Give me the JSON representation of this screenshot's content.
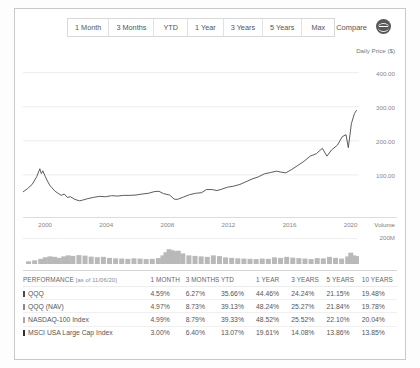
{
  "toolbar": {
    "ranges": [
      {
        "label": "1 Month"
      },
      {
        "label": "3 Months"
      },
      {
        "label": "YTD"
      },
      {
        "label": "1 Year"
      },
      {
        "label": "3 Years"
      },
      {
        "label": "5 Years"
      },
      {
        "label": "Max"
      }
    ],
    "compare_label": "Compare",
    "compare_icon": "minus-circle-icon"
  },
  "chart_data": {
    "type": "line",
    "title": "",
    "ylabel": "Daily Price ($)",
    "xlabel": "",
    "ytick_labels": [
      "400.00",
      "300.00",
      "200.00",
      "100.00"
    ],
    "ylim": [
      0,
      440
    ],
    "xtick_labels": [
      "2000",
      "2004",
      "2008",
      "2012",
      "2016",
      "2020"
    ],
    "xlim": [
      1999,
      2021
    ],
    "grid": true,
    "legend": "none",
    "series": [
      {
        "name": "QQQ",
        "color": "#4a4a4a",
        "x": [
          1999.0,
          1999.3,
          1999.6,
          1999.9,
          2000.1,
          2000.2,
          2000.3,
          2000.45,
          2000.6,
          2000.75,
          2000.9,
          2001.1,
          2001.3,
          2001.5,
          2001.7,
          2001.9,
          2002.1,
          2002.4,
          2002.7,
          2002.9,
          2003.2,
          2003.6,
          2004.0,
          2004.4,
          2004.8,
          2005.2,
          2005.6,
          2006.0,
          2006.4,
          2006.8,
          2007.2,
          2007.6,
          2007.9,
          2008.2,
          2008.6,
          2008.9,
          2009.1,
          2009.5,
          2009.9,
          2010.3,
          2010.7,
          2011.0,
          2011.4,
          2011.7,
          2012.0,
          2012.4,
          2012.8,
          2013.2,
          2013.6,
          2014.0,
          2014.4,
          2014.8,
          2015.2,
          2015.6,
          2015.9,
          2016.2,
          2016.6,
          2017.0,
          2017.4,
          2017.8,
          2018.2,
          2018.6,
          2018.9,
          2019.2,
          2019.6,
          2019.9,
          2020.15,
          2020.3,
          2020.5,
          2020.7,
          2020.85
        ],
        "y": [
          50,
          60,
          72,
          95,
          118,
          104,
          112,
          96,
          82,
          70,
          62,
          52,
          46,
          40,
          44,
          34,
          36,
          28,
          24,
          26,
          30,
          34,
          37,
          36,
          39,
          38,
          40,
          40,
          41,
          44,
          46,
          51,
          52,
          45,
          41,
          29,
          28,
          35,
          42,
          46,
          48,
          57,
          57,
          54,
          58,
          64,
          67,
          72,
          80,
          88,
          94,
          103,
          107,
          111,
          108,
          106,
          116,
          128,
          140,
          155,
          162,
          178,
          155,
          173,
          188,
          212,
          218,
          180,
          250,
          280,
          290
        ]
      }
    ],
    "volume": {
      "label": "Volume",
      "ytick_label": "200M",
      "ylim": [
        0,
        260
      ],
      "x": [
        1999.2,
        1999.6,
        2000.0,
        2000.3,
        2000.6,
        2000.9,
        2001.2,
        2001.5,
        2001.8,
        2002.1,
        2002.5,
        2002.9,
        2003.3,
        2003.7,
        2004.1,
        2004.5,
        2004.9,
        2005.3,
        2005.7,
        2006.1,
        2006.5,
        2006.9,
        2007.3,
        2007.7,
        2008.0,
        2008.2,
        2008.4,
        2008.6,
        2008.8,
        2009.0,
        2009.3,
        2009.7,
        2010.1,
        2010.5,
        2010.9,
        2011.3,
        2011.7,
        2012.1,
        2012.5,
        2012.9,
        2013.3,
        2013.7,
        2014.1,
        2014.5,
        2014.9,
        2015.3,
        2015.7,
        2016.1,
        2016.5,
        2016.9,
        2017.3,
        2017.7,
        2018.1,
        2018.5,
        2018.9,
        2019.3,
        2019.7,
        2020.1,
        2020.3,
        2020.5,
        2020.8
      ],
      "y": [
        22,
        30,
        42,
        55,
        62,
        58,
        50,
        62,
        70,
        66,
        72,
        68,
        60,
        55,
        58,
        50,
        46,
        44,
        42,
        46,
        44,
        40,
        42,
        48,
        70,
        96,
        120,
        112,
        104,
        108,
        86,
        70,
        66,
        62,
        58,
        70,
        64,
        54,
        50,
        46,
        44,
        42,
        40,
        44,
        42,
        54,
        50,
        58,
        52,
        48,
        44,
        40,
        48,
        46,
        58,
        50,
        44,
        62,
        92,
        70,
        64
      ]
    }
  },
  "performance": {
    "header_label": "PERFORMANCE",
    "as_of": "[as of 11/06/20]",
    "columns": [
      "1 MONTH",
      "3 MONTHS",
      "YTD",
      "1 YEAR",
      "3 YEARS",
      "5 YEARS",
      "10 YEARS"
    ],
    "rows": [
      {
        "name": "QQQ",
        "color": "#4a4a4a",
        "values": [
          "4.59%",
          "6.27%",
          "35.66%",
          "44.46%",
          "24.24%",
          "21.15%",
          "19.48%"
        ]
      },
      {
        "name": "QQQ (NAV)",
        "color": "#8a8a8a",
        "values": [
          "4.97%",
          "8.73%",
          "39.13%",
          "48.24%",
          "25.27%",
          "21.84%",
          "19.78%"
        ]
      },
      {
        "name": "NASDAQ-100 Index",
        "color": "#a8a8a8",
        "values": [
          "4.99%",
          "8.79%",
          "39.33%",
          "48.52%",
          "25.52%",
          "22.10%",
          "20.04%"
        ]
      },
      {
        "name": "MSCI USA Large Cap Index",
        "color": "#2f2f2f",
        "values": [
          "3.00%",
          "6.40%",
          "13.07%",
          "19.61%",
          "14.08%",
          "13.86%",
          "13.85%"
        ]
      }
    ]
  }
}
